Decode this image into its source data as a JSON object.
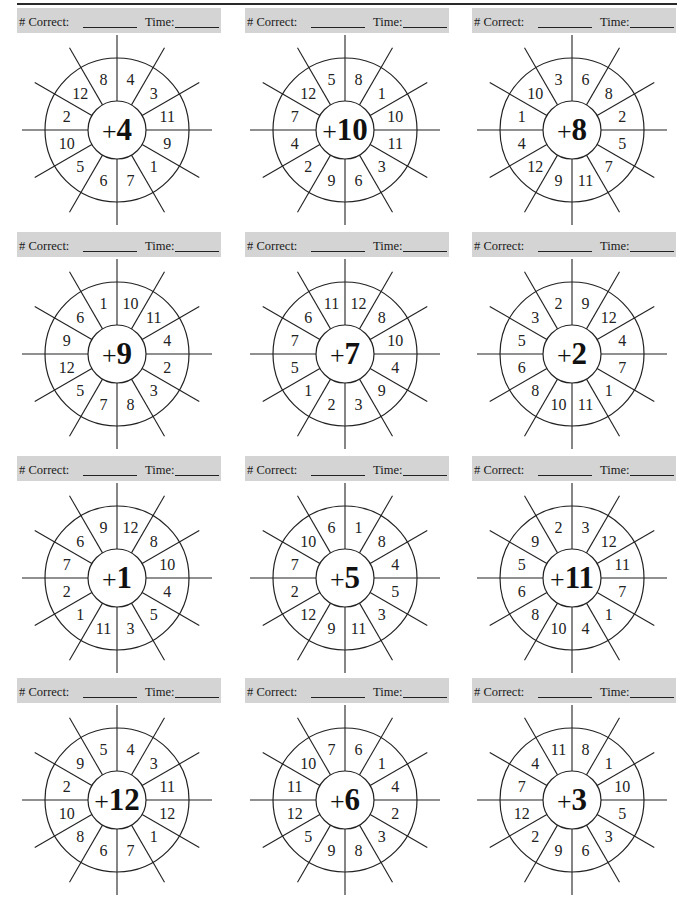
{
  "worksheet": {
    "header_labels": {
      "correct": "# Correct:",
      "time": "Time:"
    },
    "wheels": [
      {
        "addend": "+4",
        "numbers": [
          "4",
          "3",
          "11",
          "9",
          "1",
          "7",
          "6",
          "5",
          "10",
          "2",
          "12",
          "8"
        ]
      },
      {
        "addend": "+10",
        "numbers": [
          "8",
          "1",
          "10",
          "11",
          "3",
          "6",
          "9",
          "2",
          "4",
          "7",
          "12",
          "5"
        ]
      },
      {
        "addend": "+8",
        "numbers": [
          "6",
          "8",
          "2",
          "5",
          "7",
          "11",
          "9",
          "12",
          "4",
          "1",
          "10",
          "3"
        ]
      },
      {
        "addend": "+9",
        "numbers": [
          "10",
          "11",
          "4",
          "2",
          "3",
          "8",
          "7",
          "5",
          "12",
          "9",
          "6",
          "1"
        ]
      },
      {
        "addend": "+7",
        "numbers": [
          "12",
          "8",
          "10",
          "4",
          "9",
          "3",
          "2",
          "1",
          "5",
          "7",
          "6",
          "11"
        ]
      },
      {
        "addend": "+2",
        "numbers": [
          "9",
          "12",
          "4",
          "7",
          "1",
          "11",
          "10",
          "8",
          "6",
          "5",
          "3",
          "2"
        ]
      },
      {
        "addend": "+1",
        "numbers": [
          "12",
          "8",
          "10",
          "4",
          "5",
          "3",
          "11",
          "1",
          "2",
          "7",
          "6",
          "9"
        ]
      },
      {
        "addend": "+5",
        "numbers": [
          "1",
          "8",
          "4",
          "5",
          "3",
          "11",
          "9",
          "12",
          "2",
          "7",
          "10",
          "6"
        ]
      },
      {
        "addend": "+11",
        "numbers": [
          "3",
          "12",
          "11",
          "7",
          "1",
          "4",
          "10",
          "8",
          "6",
          "5",
          "9",
          "2"
        ]
      },
      {
        "addend": "+12",
        "numbers": [
          "4",
          "3",
          "11",
          "12",
          "1",
          "7",
          "6",
          "8",
          "10",
          "2",
          "9",
          "5"
        ]
      },
      {
        "addend": "+6",
        "numbers": [
          "6",
          "1",
          "4",
          "2",
          "3",
          "8",
          "9",
          "5",
          "12",
          "11",
          "10",
          "7"
        ]
      },
      {
        "addend": "+3",
        "numbers": [
          "8",
          "1",
          "10",
          "5",
          "3",
          "6",
          "9",
          "2",
          "12",
          "7",
          "4",
          "11"
        ]
      }
    ]
  }
}
